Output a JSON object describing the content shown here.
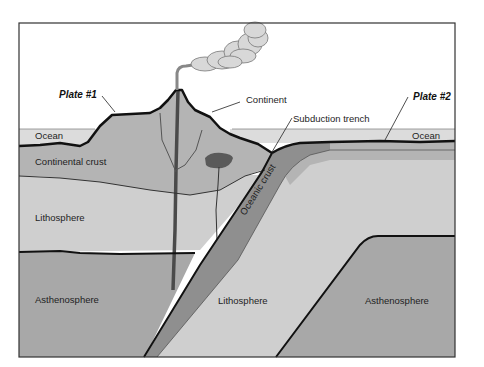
{
  "diagram": {
    "type": "cross-section",
    "labels": {
      "plate1": "Plate #1",
      "plate2": "Plate #2",
      "continent": "Continent",
      "subduction_trench": "Subduction trench",
      "ocean_left": "Ocean",
      "ocean_right": "Ocean",
      "continental_crust": "Continental crust",
      "oceanic_crust": "Oceanic crust",
      "lithosphere_left": "Lithosphere",
      "lithosphere_center": "Lithosphere",
      "asthenosphere_left": "Asthenosphere",
      "asthenosphere_right": "Asthenosphere"
    },
    "features": [
      "volcano",
      "eruption-plume",
      "magma-chamber",
      "magma-conduits"
    ],
    "colors": {
      "sky": "#ffffff",
      "ocean": "#dcdcdc",
      "continental_crust": "#b4b4b4",
      "lithosphere": "#cfcfcf",
      "asthenosphere": "#a8a8a8",
      "oceanic_crust": "#8f8f8f",
      "magma": "#5a5a5a",
      "outline": "#111111",
      "plume": "#d8d8d8"
    }
  }
}
